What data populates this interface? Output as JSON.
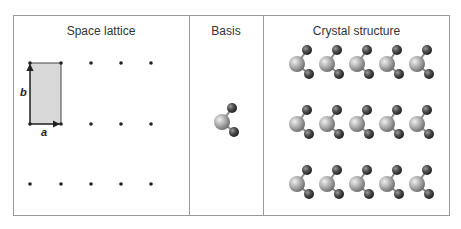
{
  "panels": {
    "space_lattice": {
      "title": "Space lattice",
      "vector_a": "a",
      "vector_b": "b"
    },
    "basis": {
      "title": "Basis"
    },
    "crystal_structure": {
      "title": "Crystal structure"
    }
  },
  "lattice": {
    "columns_x": [
      30,
      61,
      91,
      121,
      151
    ],
    "rows_y": [
      63,
      124,
      184
    ],
    "unit_cell_fill": "#d9d9d9"
  },
  "crystal": {
    "columns_x": [
      297,
      327,
      357,
      387,
      417
    ],
    "rows_y": [
      64,
      124,
      184
    ]
  },
  "colors": {
    "border": "#9a9a9a",
    "dot": "#222222",
    "large_atom": "#b5b5b5",
    "small_atom": "#4a4a4a"
  }
}
